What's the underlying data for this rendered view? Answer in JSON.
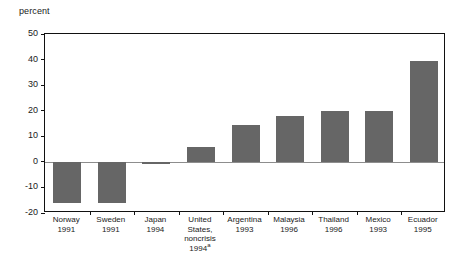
{
  "chart_data": {
    "type": "bar",
    "title": "",
    "subtitle": "",
    "xlabel": "",
    "ylabel": "percent",
    "ylim": [
      -20,
      50
    ],
    "ytick_labels": [
      "50",
      "40",
      "30",
      "20",
      "10",
      "0",
      "-10",
      "-20"
    ],
    "ytick_values": [
      50,
      40,
      30,
      20,
      10,
      0,
      -10,
      -20
    ],
    "grid": false,
    "legend": "none",
    "bar_color": "#666666",
    "zero_line_color": "#8d8d8d",
    "axis_color": "#111111",
    "categories": [
      "Norway 1991",
      "Sweden 1991",
      "Japan 1994",
      "United States, noncrisis 1994",
      "Argentina 1993",
      "Malaysia 1996",
      "Thailand 1996",
      "Mexico 1993",
      "Ecuador 1995"
    ],
    "values": [
      -16,
      -16,
      -1,
      6,
      14.5,
      18,
      20,
      20,
      39.5
    ],
    "categories_detail": [
      {
        "country": "Norway",
        "year": "1991",
        "footnote": "",
        "value": -16
      },
      {
        "country": "Sweden",
        "year": "1991",
        "footnote": "",
        "value": -16
      },
      {
        "country": "Japan",
        "year": "1994",
        "footnote": "",
        "value": -1
      },
      {
        "country": "United States, noncrisis",
        "year": "1994",
        "footnote": "a",
        "value": 6
      },
      {
        "country": "Argentina",
        "year": "1993",
        "footnote": "",
        "value": 14.5
      },
      {
        "country": "Malaysia",
        "year": "1996",
        "footnote": "",
        "value": 18
      },
      {
        "country": "Thailand",
        "year": "1996",
        "footnote": "",
        "value": 20
      },
      {
        "country": "Mexico",
        "year": "1993",
        "footnote": "",
        "value": 20
      },
      {
        "country": "Ecuador",
        "year": "1995",
        "footnote": "",
        "value": 39.5
      }
    ]
  },
  "axis": {
    "unit_label": "percent"
  },
  "xlabels": [
    {
      "line1": "Norway",
      "line2": "1991",
      "line3": "",
      "line4": "",
      "footnote": ""
    },
    {
      "line1": "Sweden",
      "line2": "1991",
      "line3": "",
      "line4": "",
      "footnote": ""
    },
    {
      "line1": "Japan",
      "line2": "1994",
      "line3": "",
      "line4": "",
      "footnote": ""
    },
    {
      "line1": "United",
      "line2": "States,",
      "line3": "noncrisis",
      "line4": "1994",
      "footnote": "a"
    },
    {
      "line1": "Argentina",
      "line2": "1993",
      "line3": "",
      "line4": "",
      "footnote": ""
    },
    {
      "line1": "Malaysia",
      "line2": "1996",
      "line3": "",
      "line4": "",
      "footnote": ""
    },
    {
      "line1": "Thailand",
      "line2": "1996",
      "line3": "",
      "line4": "",
      "footnote": ""
    },
    {
      "line1": "Mexico",
      "line2": "1993",
      "line3": "",
      "line4": "",
      "footnote": ""
    },
    {
      "line1": "Ecuador",
      "line2": "1995",
      "line3": "",
      "line4": "",
      "footnote": ""
    }
  ]
}
